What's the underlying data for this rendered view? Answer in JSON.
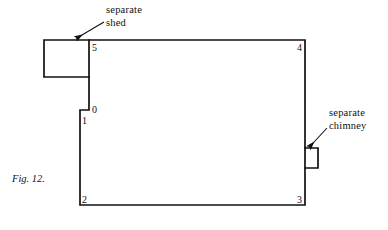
{
  "figure": {
    "caption": "Fig. 12.",
    "width": 388,
    "height": 230,
    "background_color": "#ffffff",
    "line_color": "#111111",
    "text_color": "#111111"
  },
  "annotations": [
    {
      "name": "separate-shed",
      "line1": "separate",
      "line2": "shed",
      "arrow_from": [
        104,
        22
      ],
      "arrow_to": [
        74,
        39
      ]
    },
    {
      "name": "separate-chimney",
      "line1": "separate",
      "line2": "chimney",
      "arrow_from": [
        327,
        128
      ],
      "arrow_to": [
        307,
        148
      ]
    }
  ],
  "vertices": [
    {
      "label": "0",
      "x": 92,
      "y": 111
    },
    {
      "label": "1",
      "x": 82,
      "y": 122
    },
    {
      "label": "2",
      "x": 82,
      "y": 203
    },
    {
      "label": "3",
      "x": 299,
      "y": 203
    },
    {
      "label": "4",
      "x": 299,
      "y": 50
    },
    {
      "label": "5",
      "x": 93,
      "y": 50
    }
  ],
  "shapes": {
    "main_outline": {
      "name": "main-building-outline",
      "points": "89,40 305,40 305,205 80,205 80,110 89,110 89,40"
    },
    "shed": {
      "name": "separate-shed-outline",
      "points": "89,40 44,40 44,77 89,77"
    },
    "chimney": {
      "name": "separate-chimney-outline",
      "points": "305,148 318,148 318,168 305,168"
    }
  }
}
